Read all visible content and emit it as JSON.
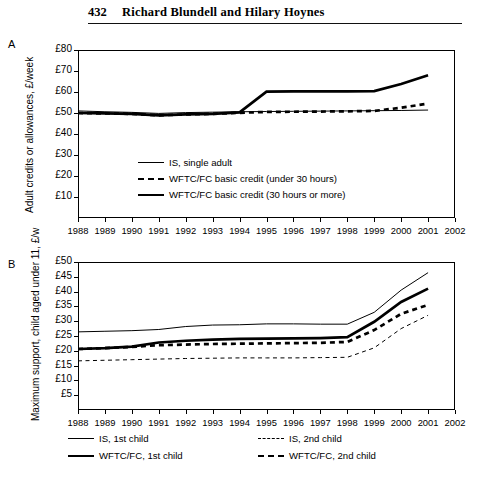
{
  "running_head": {
    "page_number": "432",
    "authors": "Richard Blundell and Hilary Hoynes"
  },
  "panel_a": {
    "letter": "A",
    "ylabel": "Adult credits or allowances, £/week",
    "yticks": [
      "£80",
      "£70",
      "£60",
      "£50",
      "£40",
      "£30",
      "£20",
      "£10"
    ],
    "xticks": [
      "1988",
      "1989",
      "1990",
      "1991",
      "1992",
      "1993",
      "1994",
      "1995",
      "1996",
      "1997",
      "1998",
      "1999",
      "2000",
      "2001",
      "2002"
    ],
    "legend": [
      {
        "label": "IS, single adult",
        "style": "thin"
      },
      {
        "label": "WFTC/FC basic credit (under 30 hours)",
        "style": "thick-dash"
      },
      {
        "label": "WFTC/FC basic credit (30 hours or more)",
        "style": "thick"
      }
    ]
  },
  "panel_b": {
    "letter": "B",
    "ylabel": "Maximum support, child aged under 11, £/w",
    "yticks": [
      "£50",
      "£45",
      "£40",
      "£35",
      "£30",
      "£25",
      "£20",
      "£15",
      "£10",
      "£5"
    ],
    "xticks": [
      "1988",
      "1989",
      "1990",
      "1991",
      "1992",
      "1993",
      "1994",
      "1995",
      "1996",
      "1997",
      "1998",
      "1999",
      "2000",
      "2001",
      "2002"
    ],
    "legend": [
      {
        "label": "IS, 1st child",
        "style": "thin"
      },
      {
        "label": "IS, 2nd child",
        "style": "thin-dash"
      },
      {
        "label": "WFTC/FC, 1st child",
        "style": "thick"
      },
      {
        "label": "WFTC/FC, 2nd child",
        "style": "thick-dash"
      }
    ]
  },
  "chart_data": [
    {
      "type": "line",
      "title": "A",
      "xlabel": "",
      "ylabel": "Adult credits or allowances, £/week",
      "x": [
        1988,
        1989,
        1990,
        1991,
        1992,
        1993,
        1994,
        1995,
        1996,
        1997,
        1998,
        1999,
        2000,
        2001
      ],
      "xlim": [
        1988,
        2002
      ],
      "ylim": [
        0,
        80
      ],
      "grid": false,
      "legend_position": "inside-center",
      "series": [
        {
          "name": "IS, single adult",
          "style": "thin-solid",
          "values": [
            51.0,
            50.6,
            50.3,
            49.8,
            50.2,
            50.4,
            50.6,
            50.7,
            50.8,
            50.9,
            51.0,
            51.1,
            51.2,
            51.4
          ]
        },
        {
          "name": "WFTC/FC basic credit (under 30 hours)",
          "style": "thick-dashed",
          "values": [
            50.0,
            49.8,
            49.6,
            48.9,
            49.3,
            49.6,
            50.1,
            50.5,
            50.6,
            50.7,
            50.8,
            51.0,
            52.5,
            54.5
          ]
        },
        {
          "name": "WFTC/FC basic credit (30 hours or more)",
          "style": "thick-solid",
          "values": [
            50.0,
            49.8,
            49.6,
            48.9,
            49.3,
            49.6,
            50.3,
            60.2,
            60.3,
            60.3,
            60.3,
            60.4,
            63.8,
            68.0
          ]
        }
      ]
    },
    {
      "type": "line",
      "title": "B",
      "xlabel": "",
      "ylabel": "Maximum support, child aged under 11, £/w",
      "x": [
        1988,
        1989,
        1990,
        1991,
        1992,
        1993,
        1994,
        1995,
        1996,
        1997,
        1998,
        1999,
        2000,
        2001
      ],
      "xlim": [
        1988,
        2002
      ],
      "ylim": [
        0,
        50
      ],
      "grid": false,
      "legend_position": "below",
      "series": [
        {
          "name": "IS, 1st child",
          "style": "thin-solid",
          "values": [
            26.4,
            26.6,
            26.8,
            27.2,
            28.2,
            28.7,
            28.8,
            29.1,
            29.1,
            29.0,
            29.0,
            33.0,
            40.5,
            46.4
          ]
        },
        {
          "name": "IS, 2nd child",
          "style": "thin-dashed",
          "values": [
            16.6,
            16.8,
            17.0,
            17.2,
            17.4,
            17.5,
            17.6,
            17.6,
            17.6,
            17.7,
            17.8,
            21.0,
            27.5,
            32.0
          ]
        },
        {
          "name": "WFTC/FC, 1st child",
          "style": "thick-solid",
          "values": [
            20.6,
            20.9,
            21.4,
            22.8,
            23.4,
            23.8,
            24.0,
            24.1,
            24.2,
            24.3,
            24.6,
            29.8,
            36.5,
            41.0
          ]
        },
        {
          "name": "WFTC/FC, 2nd child",
          "style": "thick-dashed",
          "values": [
            20.6,
            20.9,
            21.3,
            21.9,
            22.1,
            22.3,
            22.4,
            22.5,
            22.6,
            22.7,
            23.0,
            27.0,
            32.5,
            35.5
          ]
        }
      ]
    }
  ]
}
